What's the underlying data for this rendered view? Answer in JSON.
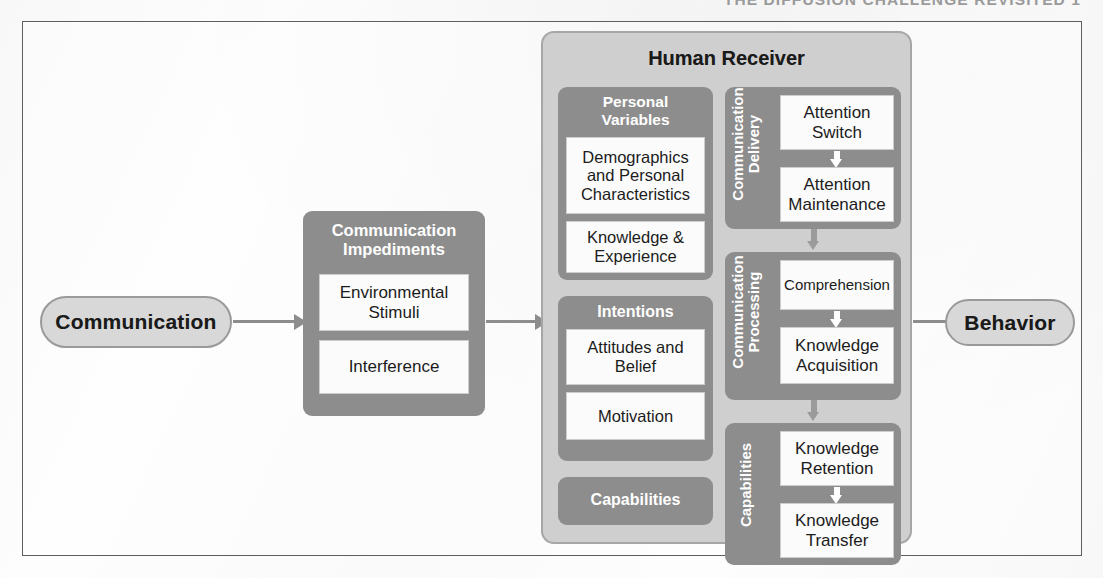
{
  "page": {
    "running_head": "THE DIFFUSION CHALLENGE REVISITED     1"
  },
  "figure": {
    "input_node": {
      "label": "Communication"
    },
    "output_node": {
      "label": "Behavior"
    },
    "impediments": {
      "title_line1": "Communication",
      "title_line2": "Impediments",
      "items": [
        {
          "label": "Environmental Stimuli"
        },
        {
          "label": "Interference"
        }
      ]
    },
    "human_receiver": {
      "title": "Human Receiver",
      "personal_variables": {
        "title_line1": "Personal",
        "title_line2": "Variables",
        "items": [
          {
            "label": "Demographics and Personal Characteristics"
          },
          {
            "label": "Knowledge & Experience"
          }
        ]
      },
      "intentions": {
        "title": "Intentions",
        "items": [
          {
            "label": "Attitudes and Belief"
          },
          {
            "label": "Motivation"
          }
        ]
      },
      "capabilities_left": {
        "title": "Capabilities"
      },
      "process_columns": [
        {
          "vertical_label_line1": "Communication",
          "vertical_label_line2": "Delivery",
          "steps": [
            {
              "label": "Attention Switch"
            },
            {
              "label": "Attention Maintenance"
            }
          ]
        },
        {
          "vertical_label_line1": "Communication",
          "vertical_label_line2": "Processing",
          "steps": [
            {
              "label": "Comprehension"
            },
            {
              "label": "Knowledge Acquisition"
            }
          ]
        },
        {
          "vertical_label_line1": "Capabilities",
          "vertical_label_line2": "",
          "steps": [
            {
              "label": "Knowledge Retention"
            },
            {
              "label": "Knowledge Transfer"
            }
          ]
        }
      ]
    },
    "colors": {
      "panel_grey": "#8d8d8d",
      "outer_panel_grey": "#cfcfcf",
      "leaf_white": "#fbfbfb",
      "arrow_grey": "#8d8d8d",
      "frame_border": "#5e5e5e",
      "pill_fill": "#d8d8d8"
    }
  }
}
